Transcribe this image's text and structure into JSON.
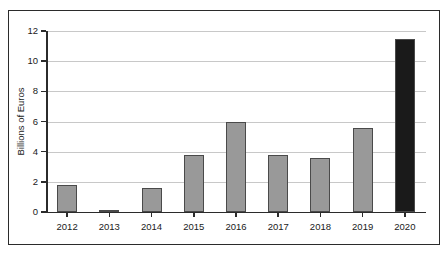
{
  "chart_data": {
    "type": "bar",
    "title": "",
    "xlabel": "",
    "ylabel": "Billions of Euros",
    "categories": [
      "2012",
      "2013",
      "2014",
      "2015",
      "2016",
      "2017",
      "2018",
      "2019",
      "2020"
    ],
    "values": [
      1.8,
      0.1,
      1.6,
      3.8,
      6.0,
      3.8,
      3.6,
      5.6,
      11.5
    ],
    "bar_colors": [
      "#999999",
      "#999999",
      "#999999",
      "#999999",
      "#999999",
      "#999999",
      "#999999",
      "#999999",
      "#1a1a1a"
    ],
    "ylim": [
      0,
      12
    ],
    "yticks": [
      0,
      2,
      4,
      6,
      8,
      10,
      12
    ],
    "ytick_labels": [
      "0",
      "2",
      "4",
      "6",
      "8",
      "10",
      "12"
    ],
    "grid": true,
    "legend": "none",
    "series": [
      {
        "name": "Billions of Euros",
        "values": [
          1.8,
          0.1,
          1.6,
          3.8,
          6.0,
          3.8,
          3.6,
          5.6,
          11.5
        ]
      }
    ]
  },
  "style": {
    "grid_color": "#c8c8c8",
    "axis_color": "#2b2b2b",
    "bar_fill": "#999999",
    "bar_edge": "#4a4a4a",
    "highlight_fill": "#1a1a1a",
    "background": "#ffffff",
    "frame_color": "#2b2b2b"
  }
}
